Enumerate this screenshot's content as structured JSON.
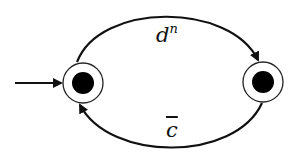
{
  "diagram": {
    "type": "state-machine",
    "states": [
      {
        "id": "s0",
        "initial": true,
        "accepting": true,
        "cx": 83,
        "cy": 83
      },
      {
        "id": "s1",
        "initial": false,
        "accepting": true,
        "cx": 263,
        "cy": 82
      }
    ],
    "transitions": [
      {
        "from": "s0",
        "to": "s1",
        "label_base": "d",
        "label_sup": "n"
      },
      {
        "from": "s1",
        "to": "s0",
        "label_base": "c",
        "label_overline": true
      }
    ],
    "colors": {
      "stroke": "#111111",
      "fill": "#ffffff",
      "dot": "#000000"
    }
  }
}
